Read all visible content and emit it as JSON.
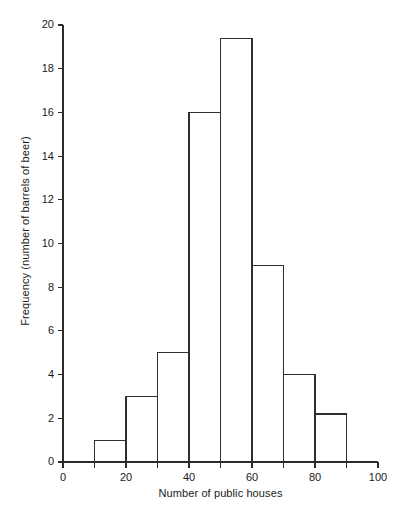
{
  "chart_data": {
    "type": "bar",
    "title": "",
    "subtitle": "",
    "xlabel": "Number of public houses",
    "ylabel": "Frequency (number of barrels of beer)",
    "xlim": [
      0,
      100
    ],
    "ylim": [
      0,
      20
    ],
    "grid": false,
    "legend": null,
    "bin_width": 10,
    "bin_edges": [
      10,
      20,
      30,
      40,
      50,
      60,
      70,
      80,
      90
    ],
    "categories": [
      "10-20",
      "20-30",
      "30-40",
      "40-50",
      "50-60",
      "60-70",
      "70-80",
      "80-90"
    ],
    "values": [
      1,
      3,
      5,
      16,
      19.4,
      9,
      4,
      2.2
    ],
    "x_ticks": [
      0,
      10,
      20,
      30,
      40,
      50,
      60,
      70,
      80,
      90,
      100
    ],
    "x_tick_labels": [
      "0",
      "",
      "20",
      "",
      "40",
      "",
      "60",
      "",
      "80",
      "",
      "100"
    ],
    "y_ticks": [
      0,
      2,
      4,
      6,
      8,
      10,
      12,
      14,
      16,
      18,
      20
    ],
    "y_tick_labels": [
      "0",
      "2",
      "4",
      "6",
      "8",
      "10",
      "12",
      "14",
      "16",
      "18",
      "20"
    ],
    "colors": {
      "bar_fill": "#ffffff",
      "bar_stroke": "#2f2f2f",
      "axis": "#2b2b2b",
      "text": "#1a1a1a",
      "background": "#ffffff"
    }
  }
}
